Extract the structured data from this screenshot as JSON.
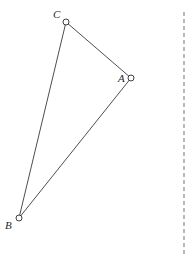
{
  "diagram": {
    "type": "triangle",
    "vertices": [
      {
        "id": "A",
        "label": "A",
        "x": 131,
        "y": 78,
        "label_x": 118,
        "label_y": 82
      },
      {
        "id": "B",
        "label": "B",
        "x": 19,
        "y": 218,
        "label_x": 5,
        "label_y": 229
      },
      {
        "id": "C",
        "label": "C",
        "x": 66,
        "y": 22,
        "label_x": 53,
        "label_y": 18
      }
    ],
    "edges": [
      {
        "from": "C",
        "to": "A"
      },
      {
        "from": "A",
        "to": "B"
      },
      {
        "from": "B",
        "to": "C"
      }
    ],
    "divider": {
      "style": "dashed",
      "x": 184,
      "y_start": 12,
      "y_end": 256,
      "color": "#8a8a8a"
    }
  }
}
